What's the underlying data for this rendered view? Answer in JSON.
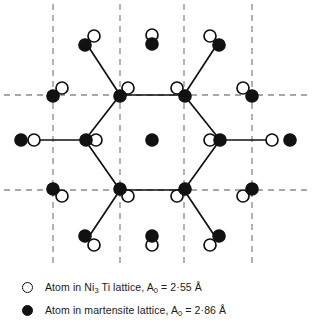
{
  "figure": {
    "colors": {
      "atom_open_fill": "#ffffff",
      "atom_stroke": "#111111",
      "atom_filled_fill": "#111111",
      "bond_color": "#111111",
      "grid_color": "#8a8a8a",
      "background": "#ffffff"
    },
    "geometry": {
      "width": 313,
      "height": 270,
      "atom_radius_open": 6.0,
      "atom_radius_filled": 6.2,
      "grid_vertical_x": [
        53,
        120,
        184,
        252
      ],
      "grid_horizontal_y": [
        95,
        190
      ],
      "grid_mid_row_y": 140,
      "hexagon_vertices": [
        [
          120,
          95
        ],
        [
          184,
          95
        ],
        [
          220,
          140
        ],
        [
          184,
          190
        ],
        [
          120,
          190
        ],
        [
          85,
          140
        ]
      ],
      "center_atom": [
        152,
        140
      ]
    },
    "bonds": [
      {
        "name": "hex-top-edge",
        "from": [
          120,
          95
        ],
        "to": [
          184,
          95
        ]
      },
      {
        "name": "hex-upper-right-edge",
        "from": [
          184,
          95
        ],
        "to": [
          220,
          140
        ]
      },
      {
        "name": "hex-lower-right-edge",
        "from": [
          220,
          140
        ],
        "to": [
          184,
          190
        ]
      },
      {
        "name": "hex-bottom-edge",
        "from": [
          184,
          190
        ],
        "to": [
          120,
          190
        ]
      },
      {
        "name": "hex-lower-left-edge",
        "from": [
          120,
          190
        ],
        "to": [
          85,
          140
        ]
      },
      {
        "name": "hex-upper-left-edge",
        "from": [
          85,
          140
        ],
        "to": [
          120,
          95
        ]
      },
      {
        "name": "spoke-top-left-out",
        "from": [
          120,
          95
        ],
        "to": [
          88,
          46
        ]
      },
      {
        "name": "spoke-top-right-out",
        "from": [
          184,
          95
        ],
        "to": [
          216,
          46
        ]
      },
      {
        "name": "spoke-bottom-left-out",
        "from": [
          120,
          190
        ],
        "to": [
          88,
          238
        ]
      },
      {
        "name": "spoke-bottom-right-out",
        "from": [
          184,
          190
        ],
        "to": [
          216,
          238
        ]
      },
      {
        "name": "spoke-left-out",
        "from": [
          85,
          140
        ],
        "to": [
          33,
          140
        ]
      },
      {
        "name": "spoke-right-out",
        "from": [
          220,
          140
        ],
        "to": [
          272,
          140
        ]
      }
    ],
    "atoms": [
      {
        "name": "atom-top-left-open",
        "type": "open",
        "x": 94,
        "y": 36
      },
      {
        "name": "atom-top-left-filled",
        "type": "filled",
        "x": 85,
        "y": 45
      },
      {
        "name": "atom-top-mid-open",
        "type": "open",
        "x": 152,
        "y": 35
      },
      {
        "name": "atom-top-mid-filled",
        "type": "filled",
        "x": 152,
        "y": 44
      },
      {
        "name": "atom-top-right-open",
        "type": "open",
        "x": 210,
        "y": 36
      },
      {
        "name": "atom-top-right-filled",
        "type": "filled",
        "x": 219,
        "y": 45
      },
      {
        "name": "atom-grid-left-upper-open",
        "type": "open",
        "x": 62,
        "y": 88
      },
      {
        "name": "atom-grid-left-upper-filled",
        "type": "filled",
        "x": 53,
        "y": 96
      },
      {
        "name": "atom-hex-v1-open",
        "type": "open",
        "x": 128,
        "y": 88
      },
      {
        "name": "atom-hex-v1-filled",
        "type": "filled",
        "x": 120,
        "y": 96
      },
      {
        "name": "atom-hex-v2-open",
        "type": "open",
        "x": 177,
        "y": 88
      },
      {
        "name": "atom-hex-v2-filled",
        "type": "filled",
        "x": 185,
        "y": 96
      },
      {
        "name": "atom-grid-right-upper-open",
        "type": "open",
        "x": 243,
        "y": 88
      },
      {
        "name": "atom-grid-right-upper-filled",
        "type": "filled",
        "x": 252,
        "y": 96
      },
      {
        "name": "atom-row-far-left-filled",
        "type": "filled",
        "x": 21,
        "y": 140
      },
      {
        "name": "atom-row-far-left-open",
        "type": "open",
        "x": 34,
        "y": 140
      },
      {
        "name": "atom-hex-v6-filled",
        "type": "filled",
        "x": 86,
        "y": 140
      },
      {
        "name": "atom-hex-v6-open",
        "type": "open",
        "x": 96,
        "y": 140
      },
      {
        "name": "atom-center-filled",
        "type": "filled",
        "x": 152,
        "y": 140
      },
      {
        "name": "atom-hex-v3-open",
        "type": "open",
        "x": 210,
        "y": 140
      },
      {
        "name": "atom-hex-v3-filled",
        "type": "filled",
        "x": 220,
        "y": 140
      },
      {
        "name": "atom-row-far-right-open",
        "type": "open",
        "x": 272,
        "y": 140
      },
      {
        "name": "atom-row-far-right-filled",
        "type": "filled",
        "x": 290,
        "y": 140
      },
      {
        "name": "atom-grid-left-lower-open",
        "type": "open",
        "x": 62,
        "y": 196
      },
      {
        "name": "atom-grid-left-lower-filled",
        "type": "filled",
        "x": 53,
        "y": 189
      },
      {
        "name": "atom-hex-v5-open",
        "type": "open",
        "x": 128,
        "y": 196
      },
      {
        "name": "atom-hex-v5-filled",
        "type": "filled",
        "x": 120,
        "y": 189
      },
      {
        "name": "atom-hex-v4-open",
        "type": "open",
        "x": 177,
        "y": 196
      },
      {
        "name": "atom-hex-v4-filled",
        "type": "filled",
        "x": 185,
        "y": 189
      },
      {
        "name": "atom-grid-right-lower-open",
        "type": "open",
        "x": 243,
        "y": 196
      },
      {
        "name": "atom-grid-right-lower-filled",
        "type": "filled",
        "x": 252,
        "y": 189
      },
      {
        "name": "atom-bottom-left-filled",
        "type": "filled",
        "x": 85,
        "y": 236
      },
      {
        "name": "atom-bottom-left-open",
        "type": "open",
        "x": 94,
        "y": 245
      },
      {
        "name": "atom-bottom-mid-filled",
        "type": "filled",
        "x": 152,
        "y": 236
      },
      {
        "name": "atom-bottom-mid-open",
        "type": "open",
        "x": 152,
        "y": 245
      },
      {
        "name": "atom-bottom-right-filled",
        "type": "filled",
        "x": 219,
        "y": 236
      },
      {
        "name": "atom-bottom-right-open",
        "type": "open",
        "x": 210,
        "y": 245
      }
    ]
  },
  "legend": {
    "entries": [
      {
        "name": "legend-ni3ti",
        "marker": "open-circle",
        "text_before": "Atom in Ni",
        "subscript": "3",
        "text_after": " Ti lattice, A",
        "param_subscript": "0",
        "value": " = 2·55 Å",
        "full_text": "Atom in Ni3 Ti lattice, A0 = 2·55 Å"
      },
      {
        "name": "legend-martensite",
        "marker": "filled-circle",
        "text_before": "Atom in martensite lattice, A",
        "subscript": "",
        "text_after": "",
        "param_subscript": "0",
        "value": " = 2·86 Å",
        "full_text": "Atom in martensite lattice, A0 = 2·86 Å"
      }
    ]
  }
}
